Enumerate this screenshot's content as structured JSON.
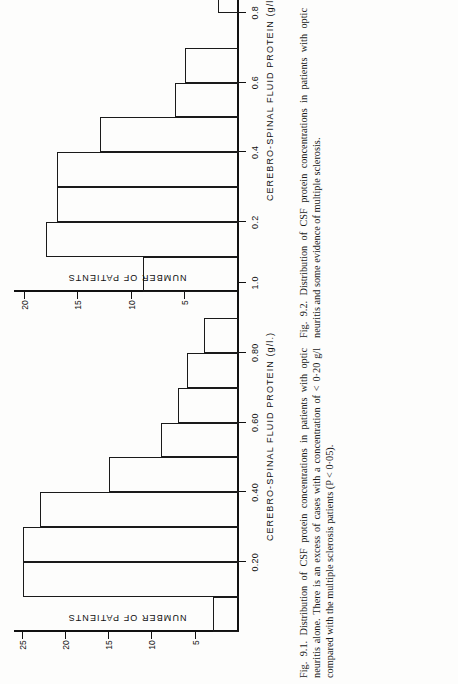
{
  "page": {
    "width": 458,
    "height": 684,
    "background": "#fdfdfc",
    "ink": "#111111"
  },
  "figures": [
    {
      "id": "fig-9-2",
      "label": "Fig. 9.2.",
      "caption_text": "Fig. 9.2.  Distribution of CSF protein concentrations in patients with optic neuritis and some evidence of multiple sclerosis.",
      "chart_data": {
        "type": "bar",
        "title": "",
        "xlabel": "CEREBRO-SPINAL FLUID PROTEIN  (g/l.)",
        "ylabel": "NUMBER OF PATIENTS",
        "categories": [
          "0.0-0.1",
          "0.1-0.2",
          "0.2-0.3",
          "0.3-0.4",
          "0.4-0.5",
          "0.5-0.6",
          "0.6-0.7",
          "0.7-0.8",
          "0.8-0.9",
          "0.9-1.0",
          "1.0-1.1"
        ],
        "bin_starts": [
          0.0,
          0.1,
          0.2,
          0.3,
          0.4,
          0.5,
          0.6,
          0.7,
          0.8,
          0.9,
          1.0
        ],
        "bin_width": 0.1,
        "values": [
          9,
          18,
          17,
          17,
          13,
          6,
          5,
          0,
          2,
          0,
          2
        ],
        "xtick_labels": [
          "0.2",
          "0.4",
          "0.6",
          "0.8",
          "1.0"
        ],
        "xtick_values": [
          0.2,
          0.4,
          0.6,
          0.8,
          1.0
        ],
        "ytick_labels": [
          "5",
          "10",
          "15",
          "20"
        ],
        "ytick_values": [
          5,
          10,
          15,
          20
        ],
        "xlim": [
          0.0,
          1.12
        ],
        "ylim": [
          0,
          21
        ],
        "grid": false,
        "legend": "none"
      }
    },
    {
      "id": "fig-9-1",
      "label": "Fig. 9.1.",
      "caption_text": "Fig. 9.1.  Distribution of CSF protein concentrations in  patients with optic neuritis alone. There is an excess of cases with a concentration of < 0·20 g/l compared with the multiple sclerosis patients (P < 0·05).",
      "chart_data": {
        "type": "bar",
        "title": "",
        "xlabel": "CEREBRO-SPINAL FLUID PROTEIN  (g/l.)",
        "ylabel": "NUMBER OF PATIENTS",
        "categories": [
          "0.0-0.1",
          "0.1-0.2",
          "0.2-0.3",
          "0.3-0.4",
          "0.4-0.5",
          "0.5-0.6",
          "0.6-0.7",
          "0.7-0.8",
          "0.8-0.9",
          "0.9-1.0"
        ],
        "bin_starts": [
          0.0,
          0.1,
          0.2,
          0.3,
          0.4,
          0.5,
          0.6,
          0.7,
          0.8,
          0.9
        ],
        "bin_width": 0.1,
        "values": [
          3,
          25,
          25,
          23,
          15,
          9,
          7,
          6,
          4,
          0
        ],
        "xtick_labels": [
          "0.20",
          "0.40",
          "0.60",
          "0.80",
          "1.0"
        ],
        "xtick_values": [
          0.2,
          0.4,
          0.6,
          0.8,
          1.0
        ],
        "ytick_labels": [
          "5",
          "10",
          "15",
          "20",
          "25"
        ],
        "ytick_values": [
          5,
          10,
          15,
          20,
          25
        ],
        "xlim": [
          0.0,
          1.12
        ],
        "ylim": [
          0,
          26
        ],
        "grid": false,
        "legend": "none"
      }
    }
  ]
}
